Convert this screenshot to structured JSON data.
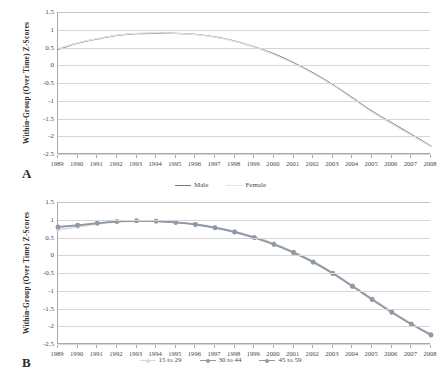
{
  "figure": {
    "panel_a_letter": "A",
    "panel_b_letter": "B"
  },
  "panelA": {
    "ylabel": "Within-Group (Over Time) Z-Scores",
    "yticks": [
      "1.5",
      "1",
      "0.5",
      "0",
      "-0.5",
      "-1",
      "-1.5",
      "-2",
      "-2.5"
    ],
    "xticks": [
      "1989",
      "1990",
      "1991",
      "1992",
      "1993",
      "1994",
      "1995",
      "1996",
      "1997",
      "1998",
      "1999",
      "2000",
      "2001",
      "2002",
      "2003",
      "2004",
      "2005",
      "2006",
      "2007",
      "2008"
    ],
    "legend": [
      {
        "label": "Male",
        "color": "#777777"
      },
      {
        "label": "Female",
        "color": "#e6e6e6"
      }
    ]
  },
  "panelB": {
    "ylabel": "Within-Group (Over Time) Z-Scores",
    "yticks": [
      "1.5",
      "1",
      "0.5",
      "0",
      "-0.5",
      "-1",
      "-1.5",
      "-2",
      "-2.5"
    ],
    "xticks": [
      "1989",
      "1990",
      "1991",
      "1992",
      "1993",
      "1994",
      "1995",
      "1996",
      "1997",
      "1998",
      "1999",
      "2000",
      "2001",
      "2002",
      "2003",
      "2004",
      "2005",
      "2006",
      "2007",
      "2008"
    ],
    "legend": [
      {
        "label": "15 to 29",
        "color": "#d9d9d9"
      },
      {
        "label": "30 to 44",
        "color": "#8f9aa6"
      },
      {
        "label": "45 to 59",
        "color": "#8f9aa6"
      }
    ]
  },
  "chart_data": [
    {
      "type": "line",
      "id": "panel-a",
      "title": "",
      "xlabel": "",
      "ylabel": "Within-Group (Over Time) Z-Scores",
      "x": [
        1989,
        1990,
        1991,
        1992,
        1993,
        1994,
        1995,
        1996,
        1997,
        1998,
        1999,
        2000,
        2001,
        2002,
        2003,
        2004,
        2005,
        2006,
        2007,
        2008
      ],
      "xlim": [
        1989,
        2008
      ],
      "ylim": [
        -2.5,
        1.5
      ],
      "grid": true,
      "legend_position": "bottom",
      "series": [
        {
          "name": "Male",
          "color": "#777777",
          "markers": false,
          "values": [
            0.45,
            0.62,
            0.74,
            0.84,
            0.89,
            0.9,
            0.9,
            0.87,
            0.8,
            0.68,
            0.52,
            0.32,
            0.07,
            -0.22,
            -0.55,
            -0.92,
            -1.3,
            -1.63,
            -1.95,
            -2.28
          ]
        },
        {
          "name": "Female",
          "color": "#e6e6e6",
          "markers": false,
          "values": [
            0.47,
            0.63,
            0.75,
            0.85,
            0.9,
            0.91,
            0.9,
            0.86,
            0.79,
            0.67,
            0.51,
            0.3,
            0.05,
            -0.24,
            -0.57,
            -0.94,
            -1.32,
            -1.65,
            -1.97,
            -2.3
          ]
        }
      ]
    },
    {
      "type": "line",
      "id": "panel-b",
      "title": "",
      "xlabel": "",
      "ylabel": "Within-Group (Over Time) Z-Scores",
      "x": [
        1989,
        1990,
        1991,
        1992,
        1993,
        1994,
        1995,
        1996,
        1997,
        1998,
        1999,
        2000,
        2001,
        2002,
        2003,
        2004,
        2005,
        2006,
        2007,
        2008
      ],
      "xlim": [
        1989,
        2008
      ],
      "ylim": [
        -2.5,
        1.5
      ],
      "grid": true,
      "legend_position": "bottom",
      "series": [
        {
          "name": "15 to 29",
          "color": "#d9d9d9",
          "markers": true,
          "values": [
            0.72,
            0.8,
            0.88,
            0.94,
            0.96,
            0.96,
            0.93,
            0.88,
            0.79,
            0.67,
            0.52,
            0.33,
            0.1,
            -0.17,
            -0.49,
            -0.85,
            -1.22,
            -1.58,
            -1.92,
            -2.22
          ]
        },
        {
          "name": "30 to 44",
          "color": "#8f9aa6",
          "markers": true,
          "values": [
            0.79,
            0.84,
            0.9,
            0.95,
            0.97,
            0.96,
            0.93,
            0.87,
            0.78,
            0.66,
            0.5,
            0.31,
            0.08,
            -0.19,
            -0.51,
            -0.87,
            -1.24,
            -1.6,
            -1.94,
            -2.24
          ]
        },
        {
          "name": "45 to 59",
          "color": "#8f9aa6",
          "markers": true,
          "values": [
            0.8,
            0.85,
            0.91,
            0.95,
            0.97,
            0.96,
            0.92,
            0.86,
            0.77,
            0.65,
            0.49,
            0.3,
            0.07,
            -0.2,
            -0.52,
            -0.88,
            -1.25,
            -1.61,
            -1.95,
            -2.25
          ]
        }
      ]
    }
  ]
}
